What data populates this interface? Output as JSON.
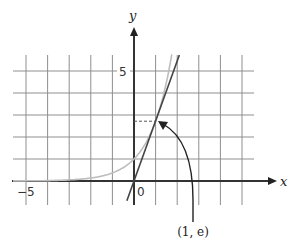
{
  "chart_data": {
    "type": "line",
    "title": "",
    "xlabel": "x",
    "ylabel": "y",
    "xlim": [
      -5.6,
      6.5
    ],
    "ylim": [
      -1.1,
      6.9
    ],
    "grid": true,
    "grid_step": 1,
    "tick_labels": {
      "x": [
        {
          "value": -5,
          "label": "−5"
        },
        {
          "value": 0,
          "label": "0"
        }
      ],
      "y": [
        {
          "value": 5,
          "label": "5"
        }
      ]
    },
    "series": [
      {
        "name": "y = e^x",
        "style": "curve",
        "color": "#bdbdbd",
        "x": [
          -5.6,
          -4,
          -3,
          -2,
          -1,
          0,
          0.5,
          1,
          1.5,
          1.75
        ],
        "y": [
          0.004,
          0.018,
          0.05,
          0.135,
          0.368,
          1,
          1.649,
          2.718,
          4.482,
          5.755
        ]
      },
      {
        "name": "tangent y = e·x",
        "style": "line",
        "color": "#444444",
        "x": [
          -0.33,
          2.1
        ],
        "y": [
          -0.9,
          5.73
        ]
      }
    ],
    "annotations": [
      {
        "type": "point",
        "x": 1,
        "y": 2.718,
        "label": "(1, e)"
      },
      {
        "type": "dashed-guide",
        "from": [
          0,
          2.718
        ],
        "to": [
          1,
          2.718
        ]
      },
      {
        "type": "curved-arrow",
        "label_position": [
          2.7,
          -2.3
        ],
        "points_to": [
          1,
          2.718
        ]
      }
    ]
  },
  "labels": {
    "x_axis": "x",
    "y_axis": "y",
    "tick_neg5": "−5",
    "tick_0": "0",
    "tick_5": "5",
    "point": "(1, e)"
  },
  "colors": {
    "grid": "#8a8a8a",
    "axis": "#333333",
    "exp_curve": "#bdbdbd",
    "tangent": "#444444",
    "arrow": "#222222"
  }
}
